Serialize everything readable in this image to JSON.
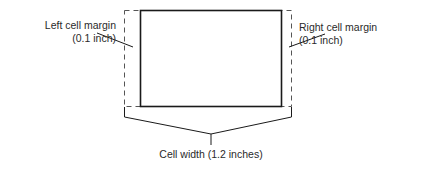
{
  "diagram": {
    "labels": {
      "left_margin": {
        "line1": "Left cell margin",
        "line2": "(0.1 inch)"
      },
      "right_margin": {
        "line1": "Right cell margin",
        "line2": "(0.1 inch)"
      },
      "cell_width": "Cell width (1.2 inches)"
    },
    "colors": {
      "stroke": "#1a1a1a",
      "dash": "#555555",
      "text": "#2a2a2a"
    }
  }
}
